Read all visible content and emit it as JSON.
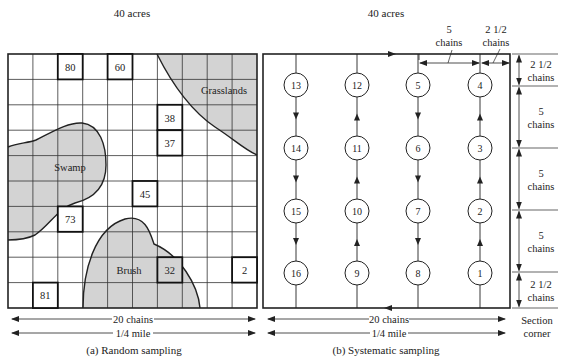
{
  "panel_a": {
    "area_label": "40 acres",
    "caption": "(a) Random sampling",
    "width_label_chains": "20 chains",
    "width_label_mile": "1/4 mile",
    "grid": {
      "cols": 10,
      "rows": 10
    },
    "regions": [
      {
        "name": "Grasslands",
        "label": "Grasslands"
      },
      {
        "name": "Swamp",
        "label": "Swamp"
      },
      {
        "name": "Brush",
        "label": "Brush"
      }
    ],
    "samples": [
      {
        "label": "80",
        "col": 2,
        "row": 0
      },
      {
        "label": "60",
        "col": 4,
        "row": 0
      },
      {
        "label": "38",
        "col": 6,
        "row": 2
      },
      {
        "label": "37",
        "col": 6,
        "row": 3
      },
      {
        "label": "45",
        "col": 5,
        "row": 5
      },
      {
        "label": "73",
        "col": 2,
        "row": 6
      },
      {
        "label": "32",
        "col": 6,
        "row": 8
      },
      {
        "label": "2",
        "col": 9,
        "row": 8
      },
      {
        "label": "81",
        "col": 1,
        "row": 9
      }
    ],
    "colors": {
      "region_fill": "#d3d3d3",
      "grid_line": "#333333"
    }
  },
  "panel_b": {
    "area_label": "40 acres",
    "caption": "(b) Systematic sampling",
    "width_label_chains": "20 chains",
    "width_label_mile": "1/4 mile",
    "corner_label_line1": "Section",
    "corner_label_line2": "corner",
    "top_dims": [
      {
        "line1": "5",
        "line2": "chains"
      },
      {
        "line1": "2 1/2",
        "line2": "chains"
      }
    ],
    "side_dims": [
      {
        "line1": "2 1/2",
        "line2": "chains"
      },
      {
        "line1": "5",
        "line2": "chains"
      },
      {
        "line1": "5",
        "line2": "chains"
      },
      {
        "line1": "5",
        "line2": "chains"
      },
      {
        "line1": "2 1/2",
        "line2": "chains"
      }
    ],
    "plots": [
      [
        "13",
        "12",
        "5",
        "4"
      ],
      [
        "14",
        "11",
        "6",
        "3"
      ],
      [
        "15",
        "10",
        "7",
        "2"
      ],
      [
        "16",
        "9",
        "8",
        "1"
      ]
    ],
    "column_directions": [
      "down",
      "up",
      "down",
      "up"
    ]
  }
}
